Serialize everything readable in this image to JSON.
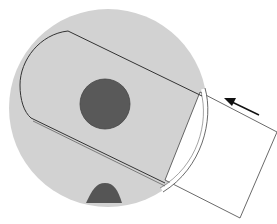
{
  "diagram": {
    "colors": {
      "background": "#ffffff",
      "disc": "#d2d2d2",
      "hub": "#595959",
      "notch": "#555555",
      "outline": "#333333",
      "card": "#ffffff"
    },
    "arrow": {
      "direction": "up-left"
    }
  }
}
